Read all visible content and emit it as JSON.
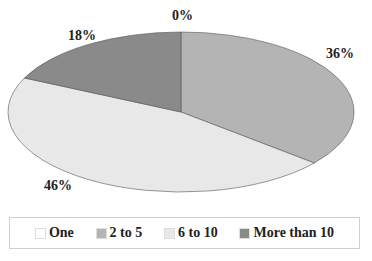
{
  "chart_data": {
    "type": "pie",
    "style": "3d-ellipse",
    "title": "",
    "categories": [
      "One",
      "2 to 5",
      "6 to 10",
      "More than 10"
    ],
    "values": [
      0,
      36,
      46,
      18
    ],
    "labels": [
      "0%",
      "36%",
      "46%",
      "18%"
    ],
    "colors": [
      "#ffffff",
      "#b4b4b4",
      "#e8e8e8",
      "#8a8a8a"
    ],
    "legend_position": "bottom"
  },
  "legend": {
    "items": [
      {
        "label": "One",
        "color": "#ffffff"
      },
      {
        "label": "2 to 5",
        "color": "#b4b4b4"
      },
      {
        "label": "6 to 10",
        "color": "#e8e8e8"
      },
      {
        "label": "More than 10",
        "color": "#8a8a8a"
      }
    ]
  }
}
